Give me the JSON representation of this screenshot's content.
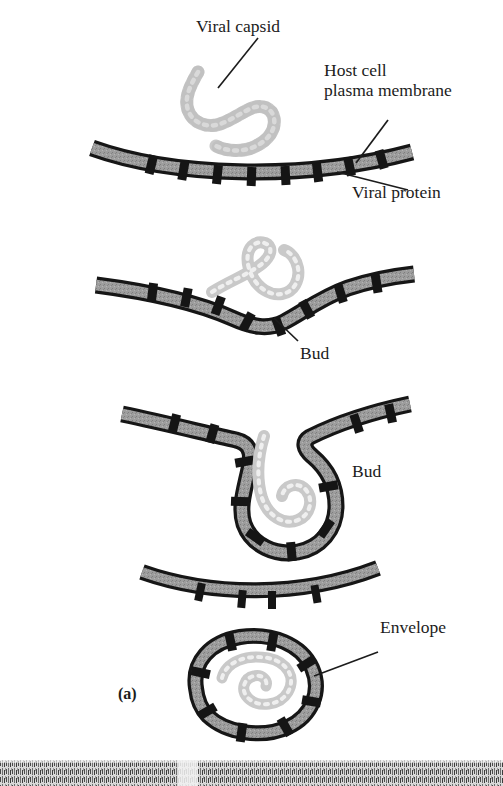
{
  "figure": {
    "panel_label": "(a)",
    "title_alt": "Viral budding through the host cell plasma membrane",
    "labels": {
      "viral_capsid": "Viral capsid",
      "host_membrane_line1": "Host cell",
      "host_membrane_line2": "plasma membrane",
      "viral_protein": "Viral protein",
      "bud_stage2": "Bud",
      "bud_stage3": "Bud",
      "envelope": "Envelope"
    },
    "colors": {
      "ink": "#1c1c1c",
      "membrane_outline": "#161616",
      "membrane_fill": "#9a9a9a",
      "protein_block": "#151515",
      "capsid": "#c4c4c4",
      "capsid_edge": "#a8a8a8",
      "background": "#ffffff",
      "strip_grain": "#8e8e8e"
    },
    "stages": [
      {
        "id": "stage-1",
        "name": "capsid-approaches-membrane",
        "caption_refs": [
          "Viral capsid",
          "Host cell plasma membrane",
          "Viral protein"
        ]
      },
      {
        "id": "stage-2",
        "name": "membrane-begins-to-dimple",
        "caption_refs": [
          "Bud"
        ]
      },
      {
        "id": "stage-3",
        "name": "deep-invagination-wraps-capsid",
        "caption_refs": [
          "Bud"
        ]
      },
      {
        "id": "stage-4",
        "name": "released-enveloped-virion",
        "caption_refs": [
          "Envelope"
        ]
      }
    ]
  }
}
